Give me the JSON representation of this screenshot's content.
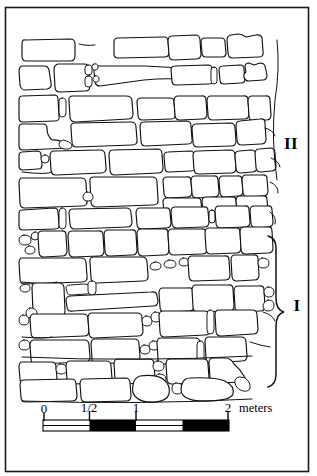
{
  "figure": {
    "type": "archaeological-wall-elevation-drawing",
    "frame": {
      "x": 5,
      "y": 7,
      "width": 304,
      "height": 465
    }
  },
  "phase_labels": [
    {
      "id": "phase-two",
      "label": "II",
      "x": 296,
      "y": 143,
      "has_bracket": false
    },
    {
      "id": "phase-one",
      "label": "I",
      "x": 299,
      "y": 305,
      "has_bracket": true
    }
  ],
  "bracket": {
    "name": "phase-one-brace",
    "top_y": 236,
    "bottom_y": 387,
    "x": 272
  },
  "scale_bar": {
    "units_label": "meters",
    "ticks": [
      {
        "label": "0",
        "value": 0
      },
      {
        "label": "1/2",
        "value": 0.5
      },
      {
        "label": "1",
        "value": 1
      },
      {
        "label": "2",
        "value": 2
      }
    ],
    "segments": [
      {
        "from": 0,
        "to": 0.5,
        "fill": "light"
      },
      {
        "from": 0.5,
        "to": 1,
        "fill": "dark"
      },
      {
        "from": 1,
        "to": 1.5,
        "fill": "light"
      },
      {
        "from": 1.5,
        "to": 2,
        "fill": "dark"
      }
    ],
    "x_start": 43,
    "x_end": 229,
    "y_top": 420,
    "bar_height": 11,
    "label_y": 413
  },
  "colors": {
    "ink": "#111111",
    "frame": "#1a1a1a",
    "paper": "#ffffff",
    "scale_dark": "#000000"
  },
  "stone_courses": [
    {
      "course": 1,
      "y": 44,
      "stone_count": 6
    },
    {
      "course": 2,
      "y": 72,
      "stone_count": 9
    },
    {
      "course": 3,
      "y": 104,
      "stone_count": 9
    },
    {
      "course": 4,
      "y": 133,
      "stone_count": 8
    },
    {
      "course": 5,
      "y": 160,
      "stone_count": 11
    },
    {
      "course": 6,
      "y": 186,
      "stone_count": 12
    },
    {
      "course": 7,
      "y": 212,
      "stone_count": 10
    },
    {
      "course": 8,
      "y": 238,
      "stone_count": 11
    },
    {
      "course": 9,
      "y": 262,
      "stone_count": 10
    },
    {
      "course": 10,
      "y": 288,
      "stone_count": 12
    },
    {
      "course": 11,
      "y": 313,
      "stone_count": 11
    },
    {
      "course": 12,
      "y": 338,
      "stone_count": 10
    },
    {
      "course": 13,
      "y": 362,
      "stone_count": 9
    },
    {
      "course": 14,
      "y": 383,
      "stone_count": 8
    }
  ]
}
